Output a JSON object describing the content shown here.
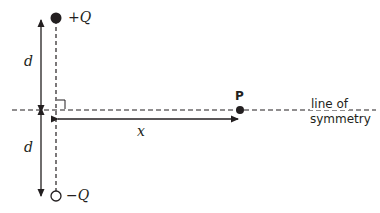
{
  "diagram": {
    "type": "electric-dipole-geometry",
    "colors": {
      "ink": "#231f20",
      "background": "#ffffff"
    },
    "charges": [
      {
        "label": "+Q",
        "style": "filled",
        "position": "top"
      },
      {
        "label": "−Q",
        "style": "hollow",
        "position": "bottom"
      }
    ],
    "distances": {
      "upper": "d",
      "lower": "d",
      "horizontal": "x"
    },
    "point": {
      "label": "P"
    },
    "axis": {
      "label_line1": "line of",
      "label_line2": "symmetry"
    },
    "right_angle_marker": true
  }
}
